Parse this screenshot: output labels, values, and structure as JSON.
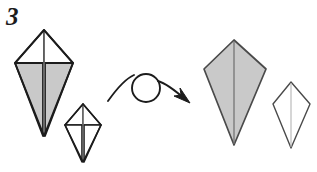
{
  "page": {
    "width": 317,
    "height": 172,
    "background": "#ffffff",
    "kind": "origami-instruction-step"
  },
  "step": {
    "number": "3",
    "caption": ""
  },
  "colors": {
    "paper_front": "#c9c9c9",
    "paper_back": "#ffffff",
    "outline_heavy": "#1c1c1c",
    "outline_light": "#4a4a4a",
    "fold_line": "#8d8d8d",
    "arrow": "#1c1c1c",
    "background": "#ffffff"
  },
  "figures": [
    {
      "id": "before-main",
      "name": "kite-base-before-large",
      "role": "before-state-large",
      "fill_upper": "#ffffff",
      "fill_lower": "#c9c9c9",
      "outline": "#1c1c1c",
      "center_fold": true,
      "geometry": {
        "apex": [
          44,
          30
        ],
        "left": [
          15,
          63
        ],
        "right": [
          73,
          63
        ],
        "bottom": [
          44,
          136
        ],
        "shoulder_y": 63
      }
    },
    {
      "id": "before-small",
      "name": "kite-base-before-small",
      "role": "before-state-small",
      "fill_upper": "#ffffff",
      "fill_lower": "#ffffff",
      "outline": "#1c1c1c",
      "center_fold": true,
      "geometry": {
        "apex": [
          83,
          104
        ],
        "left": [
          65,
          125
        ],
        "right": [
          101,
          125
        ],
        "bottom": [
          83,
          162
        ],
        "shoulder_y": 125
      }
    },
    {
      "id": "after-main",
      "name": "kite-base-after-large",
      "role": "after-state-large",
      "fill_upper": "#c9c9c9",
      "fill_lower": "#c9c9c9",
      "outline": "#4a4a4a",
      "center_fold": true,
      "geometry": {
        "apex": [
          234,
          40
        ],
        "left": [
          204,
          69
        ],
        "right": [
          266,
          69
        ],
        "bottom": [
          234,
          145
        ],
        "shoulder_y": 69
      }
    },
    {
      "id": "after-small",
      "name": "kite-base-after-small",
      "role": "after-state-small",
      "fill_upper": "#ffffff",
      "fill_lower": "#ffffff",
      "outline": "#4a4a4a",
      "center_fold": true,
      "geometry": {
        "apex": [
          291,
          82
        ],
        "left": [
          273,
          104
        ],
        "right": [
          310,
          104
        ],
        "bottom": [
          291,
          148
        ],
        "shoulder_y": 104
      }
    }
  ],
  "arrow": {
    "name": "turn-over-arrow",
    "meaning": "turn the model over",
    "color": "#1c1c1c",
    "loop_center": [
      146,
      88
    ],
    "loop_radius": 14,
    "tail_start": [
      108,
      101
    ],
    "head_tip": [
      190,
      103
    ]
  },
  "labels": {
    "step_number": "3"
  }
}
